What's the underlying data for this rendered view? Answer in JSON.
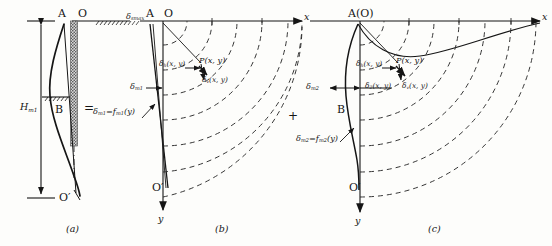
{
  "figure": {
    "panel_captions": [
      "(a)",
      "(b)",
      "(c)"
    ],
    "operators": {
      "equals": "=",
      "plus": "+"
    }
  },
  "panel_a": {
    "caption": "(a)",
    "points": {
      "A": "A",
      "O": "O",
      "B": "B",
      "O_prime": "O′"
    },
    "height_label": {
      "symbol": "H",
      "sub": "m1"
    },
    "formula": {
      "lhs": "δ",
      "lhs_sub": "m1",
      "eq": "=",
      "rhs": "f",
      "rhs_sub": "m1",
      "arg": "(y)"
    },
    "description": "Measured wall deflection curve with excavation face hatching and ground surface hatch marks"
  },
  "panel_b": {
    "caption": "(b)",
    "points": {
      "A": "A",
      "O": "O",
      "O_prime": "O′",
      "P": "P(x, y)"
    },
    "axes": {
      "x": "x",
      "y": "y"
    },
    "surface_settlement": {
      "symbol": "δ",
      "sub": "smax"
    },
    "wall_top_disp": {
      "symbol": "δ",
      "sub": "m1"
    },
    "vectors": {
      "horizontal": {
        "symbol": "δ",
        "sub": "h",
        "arg": "(x, y)"
      },
      "vertical": {
        "symbol": "δ",
        "sub": "v",
        "arg": "(x, y)"
      }
    },
    "formula": {
      "lhs": "δ",
      "lhs_sub": "m1",
      "eq": "=",
      "rhs": "f",
      "rhs_sub": "m1",
      "arg": "(y)"
    },
    "contours": "dashed quarter-circular displacement contours radiating from O"
  },
  "panel_c": {
    "caption": "(c)",
    "points": {
      "A": "A(O)",
      "B": "B",
      "O_prime": "O′",
      "P": "P(x, y)"
    },
    "axes": {
      "x": "x",
      "y": "y"
    },
    "wall_disp": {
      "symbol": "δ",
      "sub": "m2"
    },
    "vectors": {
      "horizontal": {
        "symbol": "δ",
        "sub": "h",
        "arg": "(x, y)"
      },
      "resultant": {
        "symbol": "δ",
        "sub": "2",
        "arg": "(x, y)"
      },
      "vertical": {
        "symbol": "δ",
        "sub": "v",
        "arg": "(x, y)"
      }
    },
    "formula": {
      "lhs": "δ",
      "lhs_sub": "m2",
      "eq": "=",
      "rhs": "f",
      "rhs_sub": "m2",
      "arg": "(y)"
    },
    "contours": "dashed quarter-circular displacement contours radiating from A(O)"
  },
  "colors": {
    "ink": "#151515",
    "dash": "#2b2b2b",
    "paper": "#fdfdfb"
  }
}
